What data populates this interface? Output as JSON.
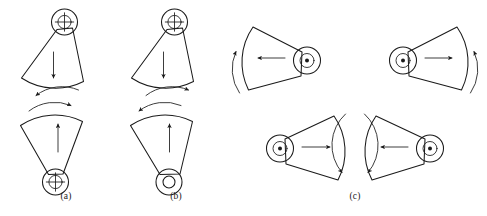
{
  "figure": {
    "background_color": "#ffffff",
    "stroke_color": "#1a1a1a",
    "panels": [
      {
        "id": "a",
        "label": "(a)",
        "label_x": 66,
        "label_y": 199,
        "description": "Two opposed vertical wedges, both pivots marked with crosshair circles",
        "shapes": [
          {
            "name": "upper-wedge",
            "orientation": "apex-up",
            "pivot_marker": "crosshair-circle",
            "linear_arrow": "down",
            "curved_arrow": "left"
          },
          {
            "name": "lower-wedge",
            "orientation": "apex-down",
            "pivot_marker": "crosshair-circle",
            "linear_arrow": "up",
            "curved_arrow": "right"
          }
        ]
      },
      {
        "id": "b",
        "label": "(b)",
        "label_x": 176,
        "label_y": 199,
        "description": "Two opposed vertical wedges, upper pivot crosshair, lower pivot plain ring",
        "shapes": [
          {
            "name": "upper-wedge",
            "orientation": "apex-up",
            "pivot_marker": "crosshair-circle",
            "linear_arrow": "down",
            "curved_arrow": "right"
          },
          {
            "name": "lower-wedge",
            "orientation": "apex-down",
            "pivot_marker": "ring-circle",
            "linear_arrow": "up",
            "curved_arrow": "left"
          }
        ]
      },
      {
        "id": "c",
        "label": "(c)",
        "label_x": 355,
        "label_y": 199,
        "description": "Four horizontal wedges in two rows; outer curved arrows point up in top row, inner curved arrows point down in bottom row",
        "shapes": [
          {
            "name": "top-left-wedge",
            "orientation": "apex-right",
            "pivot_marker": "dot-ring-circle",
            "linear_arrow": "left",
            "curved_arrow": "up-outer-left"
          },
          {
            "name": "top-right-wedge",
            "orientation": "apex-left",
            "pivot_marker": "dot-ring-circle",
            "linear_arrow": "right",
            "curved_arrow": "up-outer-right"
          },
          {
            "name": "bottom-left-wedge",
            "orientation": "apex-left",
            "pivot_marker": "dot-ring-circle",
            "linear_arrow": "right",
            "curved_arrow": "down-inner-left"
          },
          {
            "name": "bottom-right-wedge",
            "orientation": "apex-right",
            "pivot_marker": "dot-ring-circle",
            "linear_arrow": "left",
            "curved_arrow": "down-inner-right"
          }
        ]
      }
    ]
  }
}
